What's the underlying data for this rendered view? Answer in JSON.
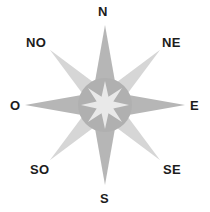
{
  "figure": {
    "name": "compass-rose",
    "background_color": "#ffffff"
  },
  "compass": {
    "center": {
      "x": 105,
      "y": 105
    },
    "colors": {
      "cardinal_point": "#b6b6b6",
      "ordinal_point": "#d6d6d6",
      "hub_circle": "#b0b0b0",
      "hub_star": "#e9e9e9",
      "label_text": "#1c1c1c"
    },
    "geometry": {
      "cardinal_tip_radius": 80,
      "ordinal_tip_radius": 78,
      "point_half_width": 17,
      "hub_outer_radius": 27,
      "hub_star_outer_radius": 24,
      "hub_star_inner_radius": 9
    },
    "labels": [
      {
        "id": "n",
        "text": "N",
        "bearing_deg": 0,
        "style": "cardinal"
      },
      {
        "id": "ne",
        "text": "NE",
        "bearing_deg": 45,
        "style": "ordinal"
      },
      {
        "id": "e",
        "text": "E",
        "bearing_deg": 90,
        "style": "cardinal"
      },
      {
        "id": "se",
        "text": "SE",
        "bearing_deg": 135,
        "style": "ordinal"
      },
      {
        "id": "s",
        "text": "S",
        "bearing_deg": 180,
        "style": "cardinal"
      },
      {
        "id": "so",
        "text": "SO",
        "bearing_deg": 225,
        "style": "ordinal"
      },
      {
        "id": "o",
        "text": "O",
        "bearing_deg": 270,
        "style": "cardinal"
      },
      {
        "id": "no",
        "text": "NO",
        "bearing_deg": 315,
        "style": "ordinal"
      }
    ]
  }
}
